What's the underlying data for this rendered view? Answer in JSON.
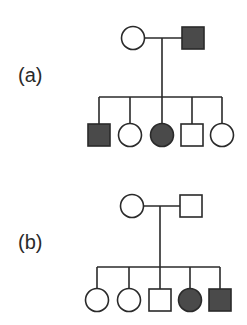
{
  "colors": {
    "line": "#2a2a2a",
    "affected_fill": "#4a4a4a",
    "unaffected_fill": "#ffffff",
    "background": "#ffffff"
  },
  "pedigrees": [
    {
      "id": "a",
      "label": "(a)",
      "label_pos": [
        18,
        82
      ],
      "mating_y": 38,
      "sibship_y": 97,
      "drop_x": 162,
      "parents": [
        {
          "sex": "female",
          "affected": false,
          "cx": 133,
          "cy": 38
        },
        {
          "sex": "male",
          "affected": true,
          "cx": 193,
          "cy": 38
        }
      ],
      "children_y": 135,
      "children": [
        {
          "sex": "male",
          "affected": true,
          "cx": 99
        },
        {
          "sex": "female",
          "affected": false,
          "cx": 130
        },
        {
          "sex": "female",
          "affected": true,
          "cx": 162
        },
        {
          "sex": "male",
          "affected": false,
          "cx": 192
        },
        {
          "sex": "female",
          "affected": false,
          "cx": 222
        }
      ]
    },
    {
      "id": "b",
      "label": "(b)",
      "label_pos": [
        18,
        249
      ],
      "mating_y": 206,
      "sibship_y": 267,
      "drop_x": 160,
      "parents": [
        {
          "sex": "female",
          "affected": false,
          "cx": 132,
          "cy": 206
        },
        {
          "sex": "male",
          "affected": false,
          "cx": 191,
          "cy": 206
        }
      ],
      "children_y": 300,
      "children": [
        {
          "sex": "female",
          "affected": false,
          "cx": 97
        },
        {
          "sex": "female",
          "affected": false,
          "cx": 129
        },
        {
          "sex": "male",
          "affected": false,
          "cx": 160
        },
        {
          "sex": "female",
          "affected": true,
          "cx": 190
        },
        {
          "sex": "male",
          "affected": true,
          "cx": 220
        }
      ]
    }
  ]
}
